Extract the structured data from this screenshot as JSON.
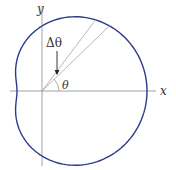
{
  "diagram": {
    "type": "polar-curve-limacon",
    "colors": {
      "curve": "#2b3a8c",
      "axes": "#8a8a8a",
      "rays": "#9a9a9a",
      "arrow": "#222222",
      "text": "#333333"
    },
    "origin": {
      "x": 42,
      "y": 91
    },
    "curve": {
      "a": 65,
      "b": 40,
      "samples": 180
    },
    "axes": {
      "x_label": "x",
      "y_label": "y",
      "x_range": [
        10,
        156
      ],
      "y_range": [
        6,
        166
      ]
    },
    "rays": [
      {
        "angle_deg": 53
      },
      {
        "angle_deg": 44
      }
    ],
    "labels": {
      "delta_theta": "Δθ",
      "theta": "θ"
    },
    "arrow": {
      "from": {
        "x": 57,
        "y": 51
      },
      "to": {
        "x": 57,
        "y": 74
      }
    },
    "theta_arc_radius": 17
  }
}
